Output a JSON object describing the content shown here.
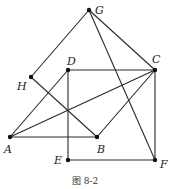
{
  "figure": {
    "caption": "图 8-2",
    "points": [
      {
        "name": "G",
        "x": 89,
        "y": 10,
        "lx": 95,
        "ly": 14
      },
      {
        "name": "H",
        "x": 31,
        "y": 77,
        "lx": 17,
        "ly": 90
      },
      {
        "name": "D",
        "x": 68,
        "y": 70,
        "lx": 67,
        "ly": 65
      },
      {
        "name": "C",
        "x": 155,
        "y": 70,
        "lx": 152,
        "ly": 63
      },
      {
        "name": "A",
        "x": 10,
        "y": 137,
        "lx": 4,
        "ly": 153
      },
      {
        "name": "B",
        "x": 97,
        "y": 137,
        "lx": 97,
        "ly": 153
      },
      {
        "name": "E",
        "x": 68,
        "y": 160,
        "lx": 54,
        "ly": 164
      },
      {
        "name": "F",
        "x": 155,
        "y": 160,
        "lx": 160,
        "ly": 168
      }
    ],
    "segments": [
      [
        "G",
        "H"
      ],
      [
        "G",
        "C"
      ],
      [
        "G",
        "F"
      ],
      [
        "H",
        "B"
      ],
      [
        "D",
        "C"
      ],
      [
        "A",
        "D"
      ],
      [
        "A",
        "C"
      ],
      [
        "A",
        "B"
      ],
      [
        "B",
        "C"
      ],
      [
        "D",
        "E"
      ],
      [
        "E",
        "F"
      ],
      [
        "C",
        "F"
      ]
    ]
  }
}
